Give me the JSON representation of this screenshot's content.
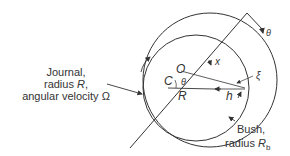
{
  "diagram": {
    "journal_label": {
      "line1": "Journal,",
      "line2_prefix": "radius ",
      "line2_symbol": "R",
      "line2_suffix": ",",
      "line3_prefix": "angular velocity ",
      "line3_symbol": "Ω"
    },
    "bush_label": {
      "line1": "Bush,",
      "line2_prefix": "radius ",
      "line2_symbol": "R",
      "line2_subscript": "b"
    },
    "symbols": {
      "theta_outer": "θ",
      "x": "x",
      "xi": "ξ",
      "O": "O",
      "C": "C",
      "theta_inner": "θ",
      "R": "R",
      "h": "h"
    },
    "colors": {
      "line": "#333333",
      "text": "#333333",
      "background": "#ffffff"
    }
  }
}
